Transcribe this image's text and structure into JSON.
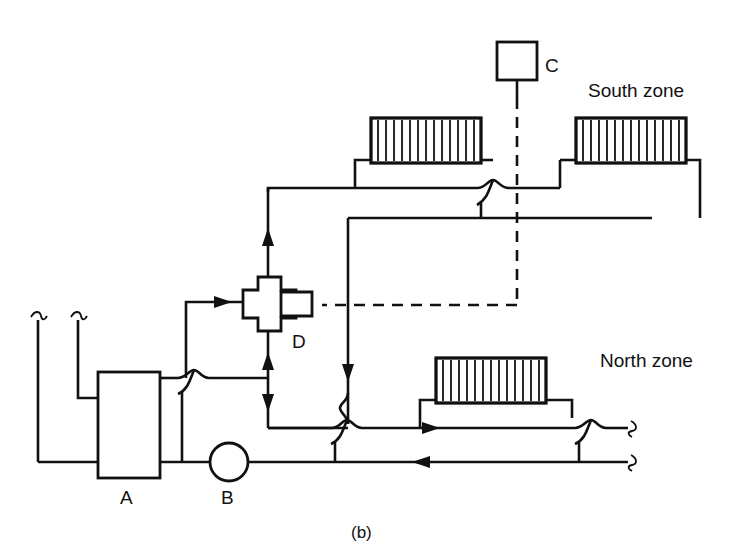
{
  "figure": {
    "caption": "(b)"
  },
  "labels": {
    "south_zone": "South zone",
    "north_zone": "North zone",
    "boiler": "A",
    "pump": "B",
    "controller": "C",
    "mixing_valve": "D"
  },
  "components": [
    {
      "id": "A",
      "name": "boiler",
      "label": "A",
      "shape": "rectangle"
    },
    {
      "id": "B",
      "name": "pump",
      "label": "B",
      "shape": "circle"
    },
    {
      "id": "C",
      "name": "controller",
      "label": "C",
      "shape": "square"
    },
    {
      "id": "D",
      "name": "three-port-mixing-valve",
      "label": "D",
      "shape": "cross-with-actuator"
    },
    {
      "id": "R1",
      "name": "radiator-south-left",
      "label": "",
      "shape": "radiator"
    },
    {
      "id": "R2",
      "name": "radiator-south-right",
      "label": "",
      "shape": "radiator"
    },
    {
      "id": "R3",
      "name": "radiator-north",
      "label": "",
      "shape": "radiator"
    }
  ],
  "colors": {
    "line": "#111111",
    "background": "#ffffff",
    "text": "#111111"
  },
  "line_styles": {
    "pipe": "solid",
    "control_signal": "dashed"
  }
}
